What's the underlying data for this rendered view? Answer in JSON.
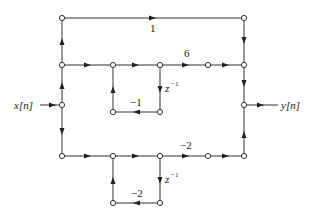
{
  "diagram": {
    "type": "signal-flow-graph",
    "input_label": "x[n]",
    "output_label": "y[n]",
    "gains": {
      "top_path": "1",
      "middle_path": "6",
      "bottom_path": "−2",
      "upper_feedback": "−1",
      "lower_feedback": "−2"
    },
    "delay_label": "z",
    "delay_exponent": "−1"
  }
}
